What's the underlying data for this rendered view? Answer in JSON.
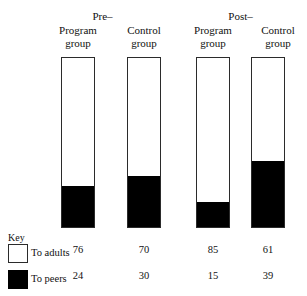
{
  "chart_data": {
    "type": "bar",
    "title": "",
    "subtitle": "",
    "xlabel": "",
    "ylabel": "",
    "ylim": [
      0,
      100
    ],
    "grid": false,
    "stacked": true,
    "units": "percent",
    "legend_position": "bottom-left",
    "legend_title": "Key",
    "categories": [
      "Program group",
      "Control group",
      "Program group",
      "Control group"
    ],
    "group_labels": [
      "Pre–",
      "Post–"
    ],
    "series": [
      {
        "name": "To adults",
        "swatch": "white",
        "color": "#ffffff",
        "values": [
          76,
          70,
          85,
          61
        ]
      },
      {
        "name": "To peers",
        "swatch": "black",
        "color": "#000000",
        "values": [
          24,
          30,
          15,
          39
        ]
      }
    ]
  },
  "groups": [
    {
      "label": "Pre–"
    },
    {
      "label": "Post–"
    }
  ],
  "columns": [
    {
      "line1": "Program",
      "line2": "group",
      "adults": "76",
      "peers": "24"
    },
    {
      "line1": "Control",
      "line2": "group",
      "adults": "70",
      "peers": "30"
    },
    {
      "line1": "Program",
      "line2": "group",
      "adults": "85",
      "peers": "15"
    },
    {
      "line1": "Control",
      "line2": "group",
      "adults": "61",
      "peers": "39"
    }
  ],
  "legend": {
    "title": "Key",
    "rows": [
      {
        "label": "To adults"
      },
      {
        "label": "To peers"
      }
    ]
  }
}
